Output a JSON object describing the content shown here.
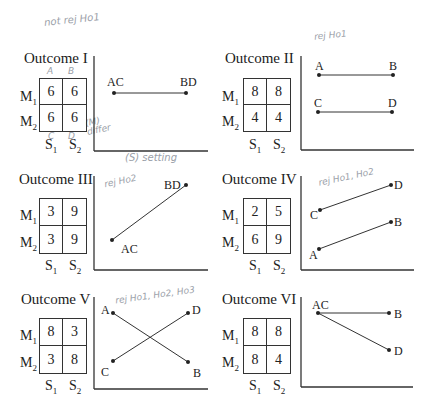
{
  "handwritten_notes": {
    "top_left": "not rej Ho1",
    "top_right": "rej Ho1",
    "outcome1_cols": [
      "A",
      "B"
    ],
    "outcome1_below": [
      "C",
      "D"
    ],
    "outcome1_side": "(M) differ",
    "outcome1_axis": "(S) setting",
    "outcome3": "rej Ho2",
    "outcome4": "rej Ho1, Ho2",
    "outcome5": "rej Ho1, Ho2, Ho3"
  },
  "labels": {
    "rows": [
      "M1",
      "M2"
    ],
    "cols": [
      "S1",
      "S2"
    ]
  },
  "panels": [
    {
      "title": "Outcome I",
      "values": [
        [
          6,
          6
        ],
        [
          6,
          6
        ]
      ],
      "lines": [
        {
          "from": "AC",
          "to": "BD"
        }
      ]
    },
    {
      "title": "Outcome II",
      "values": [
        [
          8,
          8
        ],
        [
          4,
          4
        ]
      ],
      "lines": [
        {
          "from": "A",
          "to": "B"
        },
        {
          "from": "C",
          "to": "D"
        }
      ]
    },
    {
      "title": "Outcome III",
      "values": [
        [
          3,
          9
        ],
        [
          3,
          9
        ]
      ],
      "lines": [
        {
          "from": "AC",
          "to": "BD"
        }
      ]
    },
    {
      "title": "Outcome IV",
      "values": [
        [
          2,
          5
        ],
        [
          6,
          9
        ]
      ],
      "lines": [
        {
          "from": "C",
          "to": "D"
        },
        {
          "from": "A",
          "to": "B"
        }
      ]
    },
    {
      "title": "Outcome V",
      "values": [
        [
          8,
          3
        ],
        [
          3,
          8
        ]
      ],
      "lines": [
        {
          "from": "A",
          "to": "B"
        },
        {
          "from": "C",
          "to": "D"
        }
      ]
    },
    {
      "title": "Outcome VI",
      "values": [
        [
          8,
          8
        ],
        [
          8,
          4
        ]
      ],
      "lines": [
        {
          "from": "AC",
          "to": "B"
        },
        {
          "from": "AC",
          "to": "D"
        }
      ]
    }
  ],
  "colors": {
    "ink": "#222222",
    "pencil": "#9aa0a8"
  }
}
